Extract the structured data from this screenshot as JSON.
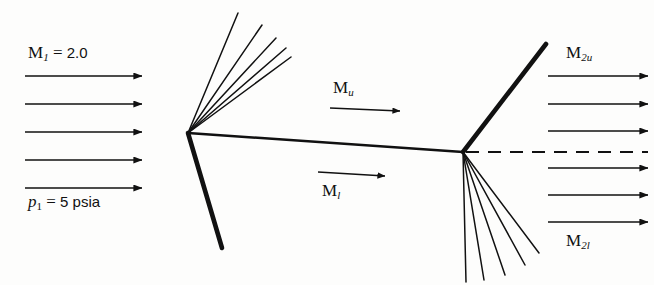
{
  "figure": {
    "background_color": "#fdfdfc",
    "line_color": "#111111"
  },
  "labels": {
    "inlet_mach": {
      "symbol": "M",
      "subscript": "1",
      "equals": "=",
      "value": "2.0",
      "text": "M1 = 2.0"
    },
    "inlet_pressure": {
      "symbol": "p",
      "subscript": "1",
      "equals": "=",
      "value": "5",
      "units": "psia",
      "text": "p1 = 5 psia"
    },
    "upper_mach": {
      "symbol": "M",
      "subscript": "u",
      "text": "Mu"
    },
    "lower_mach": {
      "symbol": "M",
      "subscript": "l",
      "text": "Ml"
    },
    "exit_upper_mach": {
      "symbol": "M",
      "subscript": "2u",
      "text": "M2u"
    },
    "exit_lower_mach": {
      "symbol": "M",
      "subscript": "2l",
      "text": "M2l"
    }
  },
  "geometry": {
    "leading_vertex": {
      "x": 188,
      "y": 133
    },
    "trailing_vertex": {
      "x": 463,
      "y": 152
    },
    "upper_surface": {
      "x1": 188,
      "y1": 133,
      "x2": 463,
      "y2": 152
    },
    "leading_shock": {
      "x1": 188,
      "y1": 133,
      "x2": 222,
      "y2": 248,
      "width": 4.5
    },
    "trailing_shock": {
      "x1": 463,
      "y1": 152,
      "x2": 546,
      "y2": 44,
      "width": 4.5
    },
    "chord_dashed": {
      "x1": 463,
      "y1": 152,
      "x2": 648,
      "y2": 152
    },
    "leading_expansion_fan": {
      "count": 5,
      "origin": {
        "x": 188,
        "y": 133
      },
      "endpoints": [
        {
          "x": 238,
          "y": 13
        },
        {
          "x": 262,
          "y": 25
        },
        {
          "x": 276,
          "y": 38
        },
        {
          "x": 286,
          "y": 48
        },
        {
          "x": 291,
          "y": 57
        }
      ]
    },
    "trailing_expansion_fan": {
      "count": 5,
      "origin": {
        "x": 463,
        "y": 152
      },
      "endpoints": [
        {
          "x": 466,
          "y": 282
        },
        {
          "x": 484,
          "y": 280
        },
        {
          "x": 505,
          "y": 275
        },
        {
          "x": 525,
          "y": 265
        },
        {
          "x": 539,
          "y": 253
        }
      ]
    },
    "inlet_arrows": {
      "count": 5,
      "x_start": 25,
      "x_end": 142,
      "y_values": [
        76,
        104,
        132,
        160,
        188
      ]
    },
    "outlet_arrows": {
      "count": 6,
      "x_start": 548,
      "x_end": 648,
      "y_values": [
        76,
        104,
        131,
        168,
        195,
        222
      ]
    },
    "upper_mach_arrow": {
      "x1": 330,
      "y1": 108,
      "x2": 400,
      "y2": 111
    },
    "lower_mach_arrow": {
      "x1": 318,
      "y1": 172,
      "x2": 385,
      "y2": 176
    }
  }
}
